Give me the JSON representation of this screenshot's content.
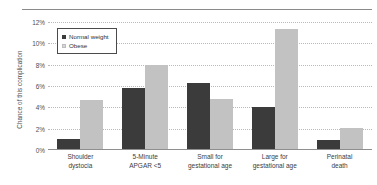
{
  "chart_data": {
    "type": "bar",
    "title": "",
    "xlabel": "",
    "ylabel": "Chance of this complication",
    "ylim": [
      0,
      12
    ],
    "yticks": [
      "0%",
      "2%",
      "4%",
      "6%",
      "8%",
      "10%",
      "12%"
    ],
    "ytick_values": [
      0,
      2,
      4,
      6,
      8,
      10,
      12
    ],
    "grid": true,
    "legend_position": "top-left-inside",
    "categories": [
      "Shoulder dystocia",
      "5-Minute APGAR <5",
      "Small for gestational age",
      "Large for gestational age",
      "Perinatal death"
    ],
    "category_lines": [
      [
        "Shoulder",
        "dystocia"
      ],
      [
        "5-Minute",
        "APGAR <5"
      ],
      [
        "Small for",
        "gestational age"
      ],
      [
        "Large for",
        "gestational age"
      ],
      [
        "Perinatal",
        "death"
      ]
    ],
    "series": [
      {
        "name": "Normal weight",
        "color": "#3b3b3b",
        "values": [
          1.0,
          5.8,
          6.3,
          4.0,
          0.9
        ]
      },
      {
        "name": "Obese",
        "color": "#c2c2c2",
        "values": [
          4.7,
          8.0,
          4.8,
          11.3,
          2.1
        ]
      }
    ]
  },
  "legend": {
    "items": [
      {
        "label": "Normal weight",
        "swatch": "normal"
      },
      {
        "label": "Obese",
        "swatch": "obese"
      }
    ]
  }
}
